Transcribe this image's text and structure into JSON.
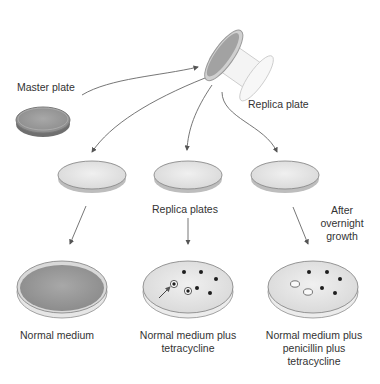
{
  "labels": {
    "master_plate": "Master plate",
    "replica_plate": "Replica plate",
    "replica_plates": "Replica plates",
    "after_growth_1": "After",
    "after_growth_2": "overnight",
    "after_growth_3": "growth",
    "normal_medium": "Normal medium",
    "tetracycline_1": "Normal medium plus",
    "tetracycline_2": "tetracycline",
    "pen_tet_1": "Normal medium plus",
    "pen_tet_2": "penicillin plus",
    "pen_tet_3": "tetracycline"
  },
  "colors": {
    "lawn": "#9a9a9a",
    "agar_light": "#e4e4e4",
    "rim": "#8a8a8a",
    "colony": "#1e1e1e",
    "arrow": "#666666"
  }
}
